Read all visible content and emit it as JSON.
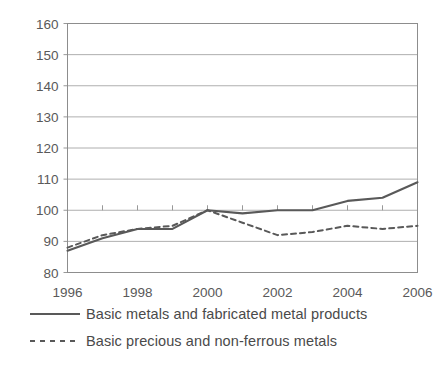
{
  "chart_data": {
    "type": "line",
    "title": "",
    "xlabel": "",
    "ylabel": "",
    "ylim": [
      80,
      160
    ],
    "ytick_step": 10,
    "yticks": [
      160,
      150,
      140,
      130,
      120,
      110,
      100,
      90,
      80
    ],
    "x": [
      1996,
      1997,
      1998,
      1999,
      2000,
      2001,
      2002,
      2003,
      2004,
      2005,
      2006
    ],
    "xticks_labeled": [
      1996,
      1998,
      2000,
      2002,
      2004,
      2006
    ],
    "grid": true,
    "grid_axis": "y",
    "legend_position": "bottom",
    "series": [
      {
        "name": "Basic metals and fabricated metal products",
        "style": "solid",
        "color": "#595959",
        "values": [
          87,
          91,
          94,
          94,
          100,
          99,
          100,
          100,
          103,
          104,
          109
        ]
      },
      {
        "name": "Basic precious and non-ferrous metals",
        "style": "dashed",
        "color": "#595959",
        "values": [
          88,
          92,
          94,
          95,
          100,
          96,
          92,
          93,
          95,
          94,
          95
        ]
      }
    ]
  },
  "axes": {
    "y_tick_labels": [
      "160",
      "150",
      "140",
      "130",
      "120",
      "110",
      "100",
      "90",
      "80"
    ],
    "x_tick_labels": [
      "1996",
      "1998",
      "2000",
      "2002",
      "2004",
      "2006"
    ]
  },
  "legend": {
    "items": [
      {
        "label": "Basic metals and fabricated metal products",
        "style": "solid"
      },
      {
        "label": "Basic precious and non-ferrous metals",
        "style": "dashed"
      }
    ]
  },
  "colors": {
    "line": "#595959",
    "gridline": "#9a9a9a",
    "border": "#8d8d8d",
    "text": "#595959",
    "background": "#ffffff"
  }
}
